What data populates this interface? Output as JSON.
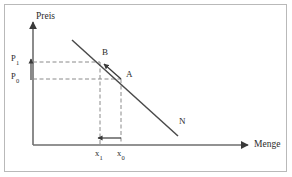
{
  "figure": {
    "type": "economics-demand-curve-diagram",
    "background_color": "#ffffff",
    "border_color": "#b9b9b9",
    "line_color": "#4a4a4a",
    "dash_color": "#8a8a8a",
    "text_color": "#2b2b2b"
  },
  "axes": {
    "y_label": "Preis",
    "x_label": "Menge",
    "origin": {
      "x": 33,
      "y": 145
    },
    "y_top": {
      "x": 33,
      "y": 20
    },
    "x_right": {
      "x": 250,
      "y": 145
    }
  },
  "curve": {
    "label": "N",
    "label_pos": {
      "x": 180,
      "y": 122
    },
    "start": {
      "x": 72,
      "y": 40
    },
    "end": {
      "x": 178,
      "y": 136
    }
  },
  "points": [
    {
      "name": "B",
      "label": "B",
      "x": 100,
      "y": 62,
      "label_x": 103,
      "label_y": 52
    },
    {
      "name": "A",
      "label": "A",
      "x": 121,
      "y": 79,
      "label_x": 126,
      "label_y": 73
    }
  ],
  "price_ticks": [
    {
      "label": "P",
      "sub": "1",
      "value_y": 62,
      "label_x": 11,
      "label_y": 55
    },
    {
      "label": "P",
      "sub": "0",
      "value_y": 79,
      "label_x": 11,
      "label_y": 73
    }
  ],
  "quantity_ticks": [
    {
      "label": "x",
      "sub": "1",
      "value_x": 100,
      "label_x": 96,
      "label_y": 150
    },
    {
      "label": "x",
      "sub": "0",
      "value_x": 121,
      "label_x": 117,
      "label_y": 150
    }
  ],
  "annotations": [
    {
      "name": "price-increase-arrow",
      "direction": "up",
      "from": {
        "x": 31,
        "y": 79
      },
      "to": {
        "x": 31,
        "y": 60
      }
    },
    {
      "name": "quantity-decrease-arrow",
      "direction": "left",
      "from": {
        "x": 121,
        "y": 138
      },
      "to": {
        "x": 99,
        "y": 138
      }
    },
    {
      "name": "movement-along-curve-arrow",
      "direction": "up-left",
      "from": {
        "x": 120,
        "y": 78
      },
      "to": {
        "x": 104,
        "y": 64
      }
    }
  ]
}
